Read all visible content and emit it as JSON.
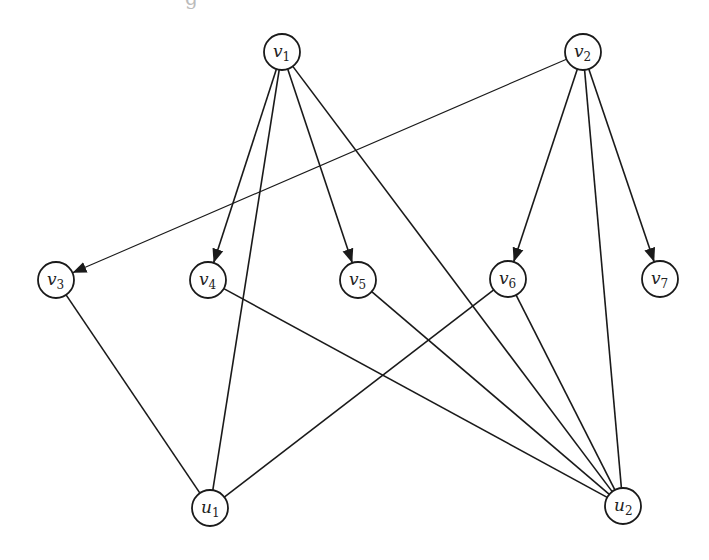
{
  "diagram": {
    "type": "directed-bipartite-graph",
    "top_fragment_text": "g",
    "colors": {
      "stroke": "#1a1a1a",
      "background": "#ffffff"
    },
    "node_radius": 18,
    "nodes": [
      {
        "id": "v1",
        "base": "v",
        "sub": "1",
        "x": 282,
        "y": 52
      },
      {
        "id": "v2",
        "base": "v",
        "sub": "2",
        "x": 583,
        "y": 52
      },
      {
        "id": "v3",
        "base": "v",
        "sub": "3",
        "x": 56,
        "y": 280
      },
      {
        "id": "v4",
        "base": "v",
        "sub": "4",
        "x": 208,
        "y": 280
      },
      {
        "id": "v5",
        "base": "v",
        "sub": "5",
        "x": 358,
        "y": 280
      },
      {
        "id": "v6",
        "base": "v",
        "sub": "6",
        "x": 508,
        "y": 279
      },
      {
        "id": "v7",
        "base": "v",
        "sub": "7",
        "x": 660,
        "y": 279
      },
      {
        "id": "u1",
        "base": "u",
        "sub": "1",
        "x": 210,
        "y": 508
      },
      {
        "id": "u2",
        "base": "u",
        "sub": "2",
        "x": 623,
        "y": 506
      }
    ],
    "edges": [
      {
        "from": "v1",
        "to": "v4",
        "directed": true,
        "thin": false
      },
      {
        "from": "v1",
        "to": "v5",
        "directed": true,
        "thin": false
      },
      {
        "from": "v1",
        "to": "u1",
        "directed": false,
        "thin": false
      },
      {
        "from": "v1",
        "to": "u2",
        "directed": false,
        "thin": false
      },
      {
        "from": "v2",
        "to": "v3",
        "directed": true,
        "thin": true
      },
      {
        "from": "v2",
        "to": "v6",
        "directed": true,
        "thin": false
      },
      {
        "from": "v2",
        "to": "v7",
        "directed": true,
        "thin": false
      },
      {
        "from": "v2",
        "to": "u2",
        "directed": false,
        "thin": false
      },
      {
        "from": "v3",
        "to": "u1",
        "directed": false,
        "thin": false
      },
      {
        "from": "v4",
        "to": "u2",
        "directed": false,
        "thin": false
      },
      {
        "from": "v5",
        "to": "u2",
        "directed": false,
        "thin": false
      },
      {
        "from": "v6",
        "to": "u1",
        "directed": false,
        "thin": false
      },
      {
        "from": "v6",
        "to": "u2",
        "directed": false,
        "thin": false
      }
    ]
  }
}
